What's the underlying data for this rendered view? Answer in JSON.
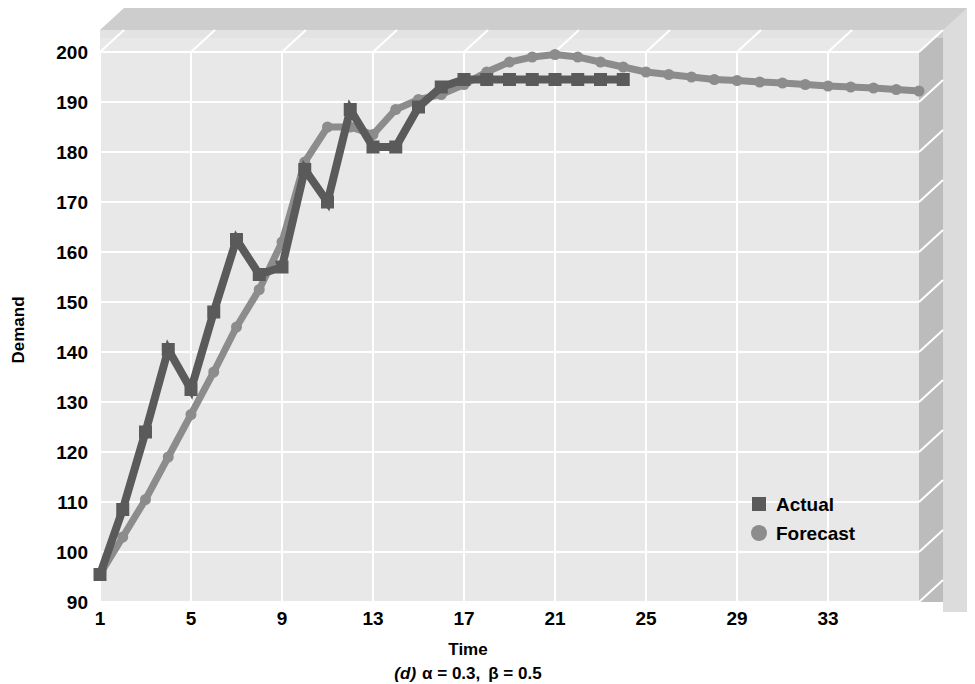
{
  "chart_data": {
    "type": "line",
    "title": "",
    "subtitle": "",
    "caption": "(d) α = 0.3, β = 0.5",
    "caption_label": "(d)",
    "caption_alpha": "α = 0.3,",
    "caption_beta": "β = 0.5",
    "xlabel": "Time",
    "ylabel": "Demand",
    "xlim": [
      1,
      37
    ],
    "ylim": [
      90,
      200
    ],
    "xticks": [
      1,
      5,
      9,
      13,
      17,
      21,
      25,
      29,
      33
    ],
    "yticks": [
      90,
      100,
      110,
      120,
      130,
      140,
      150,
      160,
      170,
      180,
      190,
      200
    ],
    "grid": true,
    "legend_position": "inside-right-lower",
    "style": "3d-area-plot",
    "colors": {
      "actual": "#5a5a5a",
      "forecast": "#8c8c8c",
      "plot_background": "#e8e8e8",
      "gridline": "#ffffff",
      "page_background": "#ffffff",
      "wall_top": "#cfcfcf",
      "wall_right": "#bdbdbd",
      "wall_outer": "#d9d9d9"
    },
    "x": [
      1,
      2,
      3,
      4,
      5,
      6,
      7,
      8,
      9,
      10,
      11,
      12,
      13,
      14,
      15,
      16,
      17,
      18,
      19,
      20,
      21,
      22,
      23,
      24,
      25,
      26,
      27,
      28,
      29,
      30,
      31,
      32,
      33,
      34,
      35,
      36,
      37
    ],
    "series": [
      {
        "name": "Actual",
        "marker": "square",
        "color": "#5a5a5a",
        "values": [
          95.5,
          108.5,
          124,
          140.5,
          132.5,
          148,
          162.5,
          155.5,
          157,
          176.5,
          170,
          188.5,
          181,
          181,
          189,
          193,
          194.5,
          194.5,
          194.5,
          194.5,
          194.5,
          194.5,
          194.5,
          194.5,
          null,
          null,
          null,
          null,
          null,
          null,
          null,
          null,
          null,
          null,
          null,
          null,
          null
        ]
      },
      {
        "name": "Forecast",
        "marker": "circle",
        "color": "#8c8c8c",
        "values": [
          95.5,
          103,
          110.5,
          119,
          127.5,
          136,
          145,
          152.5,
          162,
          178,
          185,
          185,
          183.5,
          188.5,
          190.5,
          191.5,
          193.5,
          196,
          198,
          199,
          199.5,
          199,
          198,
          197,
          196,
          195.5,
          195,
          194.5,
          194.3,
          194,
          193.8,
          193.5,
          193.2,
          193,
          192.8,
          192.5,
          192.2
        ]
      }
    ],
    "legend": [
      {
        "label": "Actual",
        "marker": "square",
        "color": "#5a5a5a"
      },
      {
        "label": "Forecast",
        "marker": "circle",
        "color": "#8c8c8c"
      }
    ]
  }
}
